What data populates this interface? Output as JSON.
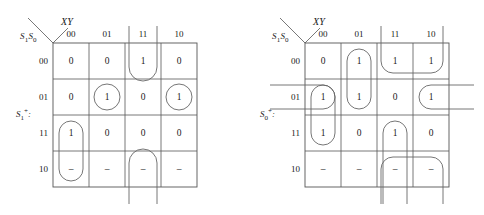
{
  "figure": {
    "type": "karnaugh-map-pair"
  },
  "maps": [
    {
      "id": "left",
      "output_label": "S₁⁺:",
      "output_base": "S",
      "output_sub": "1",
      "output_sup": "+",
      "col_var_label": "XY",
      "row_var_base": "S",
      "row_var_subs": "1 0",
      "row_var_label": "S₁S₀",
      "col_headers": [
        "00",
        "01",
        "11",
        "10"
      ],
      "row_headers": [
        "00",
        "01",
        "11",
        "10"
      ],
      "cells": [
        [
          "0",
          "0",
          "1",
          "0"
        ],
        [
          "0",
          "1",
          "0",
          "1"
        ],
        [
          "1",
          "0",
          "0",
          "0"
        ],
        [
          "–",
          "–",
          "–",
          "–"
        ]
      ],
      "groups": [
        {
          "name": "group-col11-row00-wrap-up",
          "shape": "wrap-up",
          "col": 2,
          "row": 0
        },
        {
          "name": "group-col11-row10-wrap-down",
          "shape": "wrap-down",
          "col": 2,
          "row": 3
        },
        {
          "name": "group-cell-r01-c01",
          "shape": "circle",
          "col": 1,
          "row": 1
        },
        {
          "name": "group-cell-r01-c10",
          "shape": "circle",
          "col": 3,
          "row": 1
        },
        {
          "name": "group-col00-rows11-10",
          "shape": "vpill",
          "col": 0,
          "row": 2,
          "span": 2
        }
      ]
    },
    {
      "id": "right",
      "output_label": "S₀⁺:",
      "output_base": "S",
      "output_sub": "0",
      "output_sup": "+",
      "col_var_label": "XY",
      "row_var_base": "S",
      "row_var_subs": "1 0",
      "row_var_label": "S₁S₀",
      "col_headers": [
        "00",
        "01",
        "11",
        "10"
      ],
      "row_headers": [
        "00",
        "01",
        "11",
        "10"
      ],
      "cells": [
        [
          "0",
          "1",
          "1",
          "1"
        ],
        [
          "1",
          "1",
          "0",
          "1"
        ],
        [
          "1",
          "0",
          "1",
          "0"
        ],
        [
          "–",
          "–",
          "–",
          "–"
        ]
      ],
      "groups": [
        {
          "name": "group-col01-rows00-01",
          "shape": "vpill",
          "col": 1,
          "row": 0,
          "span": 2
        },
        {
          "name": "group-row00-cols11-10-wrap-up",
          "shape": "hwrap-up",
          "col": 2,
          "row": 0,
          "span": 2
        },
        {
          "name": "group-col00-rows01-11",
          "shape": "vpill",
          "col": 0,
          "row": 1,
          "span": 2
        },
        {
          "name": "group-row01-wrap-sides",
          "shape": "hwrap-sides",
          "row": 1
        },
        {
          "name": "group-col11-rows11-10-wrapdn",
          "shape": "vwrap-down",
          "col": 2,
          "row": 2,
          "span": 2
        },
        {
          "name": "group-row10-cols11-10-wrapdn",
          "shape": "hwrap-down",
          "col": 2,
          "row": 3,
          "span": 2
        }
      ]
    }
  ],
  "colors": {
    "ink": "#1a1a1a",
    "grid": "#555555",
    "loop": "#666666",
    "background": "#ffffff"
  }
}
